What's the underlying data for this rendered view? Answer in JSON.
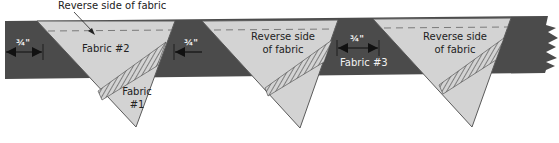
{
  "diagram": {
    "callout": "Reverse side of fabric",
    "measurement": "3/4\"",
    "measurement_display": "¾\"",
    "triangles": [
      {
        "label_top": "Fabric #2",
        "label_bottom": "Fabric\n#1",
        "label_bottom_line1": "Fabric",
        "label_bottom_line2": "#1"
      },
      {
        "label_top_line1": "Reverse side",
        "label_top_line2": "of fabric"
      },
      {
        "label_top_line1": "Reverse side",
        "label_top_line2": "of fabric"
      }
    ],
    "band_label": "Fabric #3",
    "caption_truncated": "… fabric #3"
  },
  "colors": {
    "band": "#4b4b4b",
    "triangle": "#d3d3d3",
    "outline": "#5a5a5a",
    "dash": "#7a7a7a",
    "hatch": "#444444"
  }
}
